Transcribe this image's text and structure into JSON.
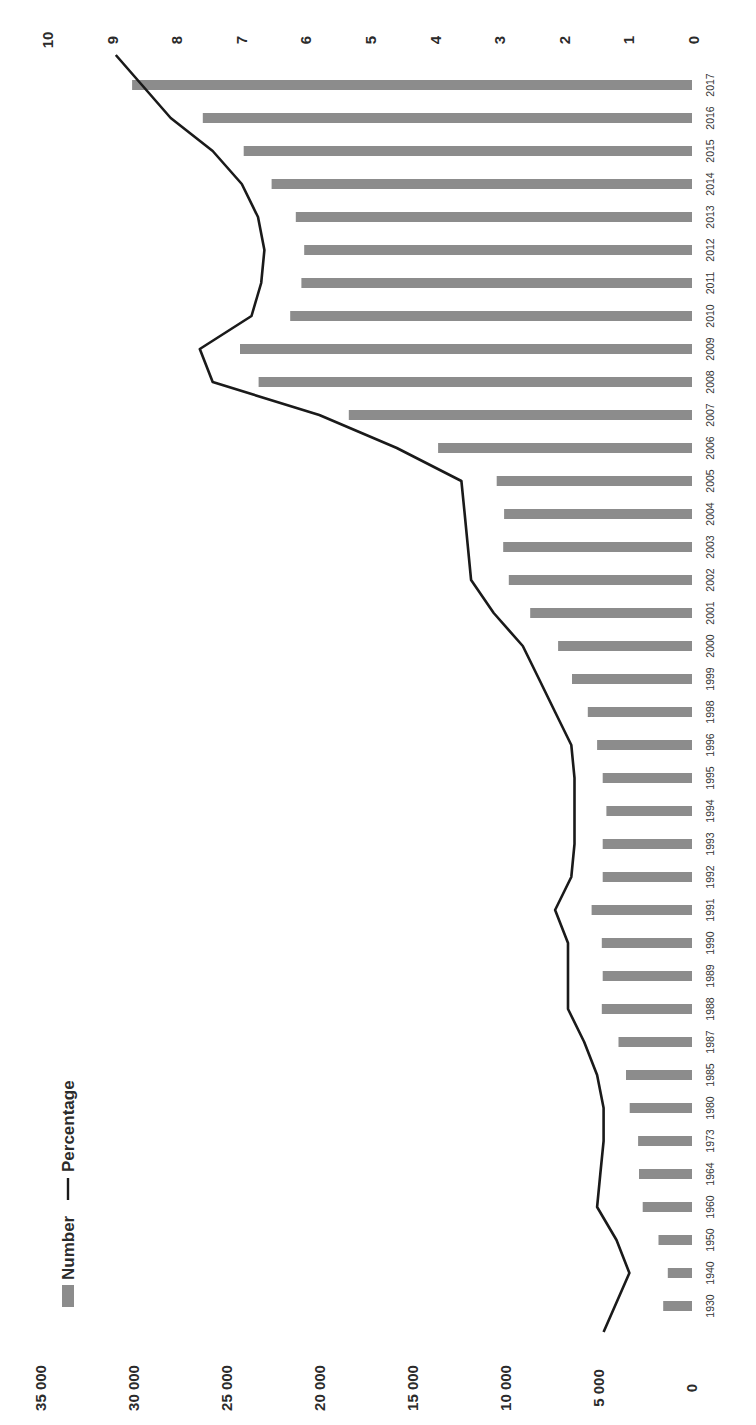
{
  "chart_data": {
    "type": "bar",
    "combo": "bar + line (dual axis)",
    "orientation_note": "image rotated 90° clockwise",
    "title": "",
    "xlabel": "",
    "ylabel": "",
    "categories": [
      "1930",
      "1940",
      "1950",
      "1960",
      "1964",
      "1973",
      "1980",
      "1985",
      "1987",
      "1988",
      "1989",
      "1990",
      "1991",
      "1992",
      "1993",
      "1994",
      "1995",
      "1996",
      "1998",
      "1999",
      "2000",
      "2001",
      "2002",
      "2003",
      "2004",
      "2005",
      "2006",
      "2007",
      "2008",
      "2009",
      "2010",
      "2011",
      "2012",
      "2013",
      "2014",
      "2015",
      "2016",
      "2017"
    ],
    "series": [
      {
        "name": "Number",
        "type": "bar",
        "axis": "primary",
        "color": "#8c8c8c",
        "values": [
          1550,
          1300,
          1800,
          2650,
          2850,
          2900,
          3350,
          3550,
          3950,
          4850,
          4800,
          4850,
          5400,
          4800,
          4800,
          4600,
          4800,
          5100,
          5600,
          6450,
          7200,
          8700,
          9850,
          10150,
          10100,
          10500,
          13650,
          18450,
          23300,
          24300,
          21600,
          21000,
          20850,
          21300,
          22600,
          24100,
          26300,
          30100
        ]
      },
      {
        "name": "Percentage",
        "type": "line",
        "axis": "secondary",
        "color": "#1a1a1a",
        "values": [
          1.4,
          1.0,
          1.2,
          1.5,
          1.45,
          1.4,
          1.4,
          1.5,
          1.7,
          1.95,
          1.95,
          1.95,
          2.15,
          1.9,
          1.85,
          1.85,
          1.85,
          1.9,
          2.15,
          2.4,
          2.65,
          3.1,
          3.45,
          3.5,
          3.55,
          3.6,
          4.6,
          5.8,
          7.45,
          7.65,
          6.85,
          6.7,
          6.65,
          6.75,
          7.0,
          7.45,
          8.1,
          8.95
        ]
      }
    ],
    "primary_axis": {
      "ylim": [
        0,
        35000
      ],
      "ticks": [
        "0",
        "5 000",
        "10 000",
        "15 000",
        "20 000",
        "25 000",
        "30 000",
        "35 000"
      ]
    },
    "secondary_axis": {
      "ylim": [
        0,
        10
      ],
      "ticks": [
        "0",
        "1",
        "2",
        "3",
        "4",
        "5",
        "6",
        "7",
        "8",
        "9",
        "10"
      ]
    },
    "legend": {
      "position": "top-left",
      "entries": [
        "Number",
        "Percentage"
      ]
    },
    "grid": false
  }
}
